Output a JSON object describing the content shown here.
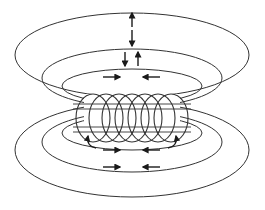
{
  "diagram": {
    "type": "solenoid-magnetic-field",
    "colors": {
      "line": "#333333",
      "arrow": "#1a1a1a",
      "background": "#ffffff"
    },
    "coil": {
      "turns": 7,
      "cx": 132,
      "cy": 118,
      "radius_x": 9,
      "radius_y": 24,
      "x_start": 93,
      "x_end": 171
    },
    "upper_loops": [
      {
        "cx": 132,
        "cy": 55,
        "rx": 117,
        "ry": 42
      },
      {
        "cx": 132,
        "cy": 78,
        "rx": 90,
        "ry": 29
      },
      {
        "cx": 132,
        "cy": 86,
        "rx": 70,
        "ry": 17
      }
    ],
    "lower_loops": [
      {
        "cx": 132,
        "cy": 150,
        "rx": 117,
        "ry": 47
      },
      {
        "cx": 132,
        "cy": 142,
        "rx": 90,
        "ry": 30
      },
      {
        "cx": 132,
        "cy": 133,
        "rx": 70,
        "ry": 17
      }
    ],
    "arrows": [
      {
        "x1": 132,
        "y1": 27,
        "x2": 132,
        "y2": 13,
        "label": "up"
      },
      {
        "x1": 132,
        "y1": 30,
        "x2": 132,
        "y2": 46,
        "label": "down"
      },
      {
        "x1": 125,
        "y1": 52,
        "x2": 125,
        "y2": 66,
        "label": "down"
      },
      {
        "x1": 138,
        "y1": 66,
        "x2": 138,
        "y2": 52,
        "label": "up"
      },
      {
        "x1": 103,
        "y1": 77,
        "x2": 120,
        "y2": 77,
        "label": "right"
      },
      {
        "x1": 160,
        "y1": 77,
        "x2": 143,
        "y2": 77,
        "label": "left"
      },
      {
        "x1": 103,
        "y1": 150,
        "x2": 120,
        "y2": 150,
        "label": "right"
      },
      {
        "x1": 160,
        "y1": 150,
        "x2": 143,
        "y2": 150,
        "label": "left"
      },
      {
        "x1": 103,
        "y1": 167,
        "x2": 120,
        "y2": 167,
        "label": "right"
      },
      {
        "x1": 160,
        "y1": 167,
        "x2": 143,
        "y2": 167,
        "label": "left"
      }
    ]
  }
}
